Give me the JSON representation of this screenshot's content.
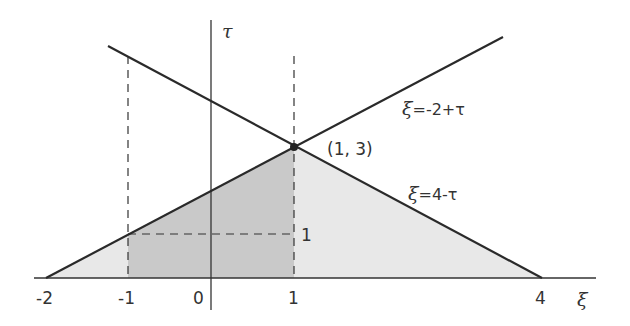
{
  "diagram": {
    "axes": {
      "x_label": "ξ",
      "y_label": "τ",
      "x_ticks": [
        "-2",
        "-1",
        "0",
        "1",
        "4"
      ],
      "y_tick_label": "1"
    },
    "point": {
      "label": "(1, 3)",
      "x": 1,
      "y": 3
    },
    "lines": [
      {
        "name": "rising",
        "label_var": "ξ",
        "label_expr": "=-2+τ"
      },
      {
        "name": "falling",
        "label_var": "ξ",
        "label_expr": "=4-τ"
      }
    ],
    "colors": {
      "dark_region": "#c9c9c9",
      "light_region": "#e8e8e8",
      "line": "#2a2a2a"
    }
  }
}
